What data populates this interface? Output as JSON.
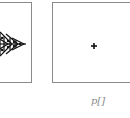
{
  "panels": [
    {
      "name": "left",
      "content": "fractal-arrow-pattern"
    },
    {
      "name": "right",
      "content": "single-point"
    }
  ],
  "labels": {
    "right_caption": "p[]"
  },
  "colors": {
    "border": "#8a8a8a",
    "mark": "#111111",
    "caption": "#8a8a8a"
  }
}
